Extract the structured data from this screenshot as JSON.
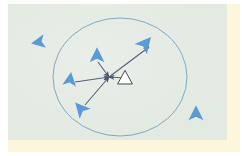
{
  "figure": {
    "caption": "",
    "background_color": "#e3eae2",
    "page_backing_color": "#fbf6dc",
    "agent_color": "#5b9bd5",
    "focal_agent_fill": "#ffffff",
    "focal_agent_stroke": "#4a4a4a",
    "circle_stroke": "#7fa8c4",
    "vector_color": "#5a5f7a"
  },
  "diagram": {
    "neighborhood_circle": {
      "label": "sensing-radius-circle",
      "cx": 112,
      "cy": 73,
      "rx": 67,
      "ry": 59
    },
    "focal_agent": {
      "label": "focal-agent",
      "x": 117,
      "y": 74,
      "size": 13,
      "rotation": 0,
      "fill": "#ffffff",
      "stroke": "#4a4a4a"
    },
    "vector_origin": {
      "x": 101,
      "y": 73
    },
    "neighbors": [
      {
        "id": "neighbor-outside-top-left",
        "x": 31,
        "y": 38,
        "size": 13,
        "rotation": -100,
        "inside_circle": false,
        "has_vector": false
      },
      {
        "id": "neighbor-upper-center",
        "x": 89,
        "y": 52,
        "size": 14,
        "rotation": 0,
        "inside_circle": true,
        "has_vector": true
      },
      {
        "id": "neighbor-upper-right",
        "x": 137,
        "y": 40,
        "size": 15,
        "rotation": 40,
        "inside_circle": true,
        "has_vector": true
      },
      {
        "id": "neighbor-left",
        "x": 62,
        "y": 76,
        "size": 13,
        "rotation": 8,
        "inside_circle": true,
        "has_vector": true
      },
      {
        "id": "neighbor-lower-left",
        "x": 73,
        "y": 105,
        "size": 14,
        "rotation": -42,
        "inside_circle": true,
        "has_vector": true
      },
      {
        "id": "neighbor-outside-bottom-right",
        "x": 188,
        "y": 110,
        "size": 14,
        "rotation": 0,
        "inside_circle": false,
        "has_vector": false
      }
    ],
    "vectors": [
      {
        "id": "vector-from-upper-center",
        "x1": 90,
        "y1": 58,
        "x2": 101,
        "y2": 73,
        "arrow_at": "end"
      },
      {
        "id": "vector-to-upper-right",
        "x1": 101,
        "y1": 73,
        "x2": 141,
        "y2": 43,
        "arrow_at": "end"
      },
      {
        "id": "vector-from-left",
        "x1": 67,
        "y1": 78,
        "x2": 101,
        "y2": 73,
        "arrow_at": "end"
      },
      {
        "id": "vector-from-lower-left",
        "x1": 77,
        "y1": 101,
        "x2": 101,
        "y2": 73,
        "arrow_at": "end"
      },
      {
        "id": "vector-resultant-to-focal",
        "x1": 117,
        "y1": 74,
        "x2": 101,
        "y2": 73,
        "arrow_at": "end"
      }
    ]
  }
}
